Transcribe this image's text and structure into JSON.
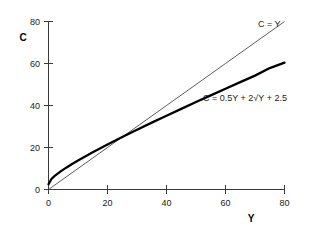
{
  "chart_data": {
    "type": "line",
    "title": "",
    "xlabel": "Y",
    "ylabel": "C",
    "xlim": [
      0,
      80
    ],
    "ylim": [
      0,
      80
    ],
    "grid": false,
    "legend_position": "inline-right",
    "xticks": [
      0,
      20,
      40,
      60,
      80
    ],
    "yticks": [
      0,
      20,
      40,
      60,
      80
    ],
    "xtick_labels": [
      "0",
      "20",
      "40",
      "60",
      "80"
    ],
    "ytick_labels": [
      "0",
      "20",
      "40",
      "60",
      "80"
    ],
    "series": [
      {
        "name": "C = Y",
        "label": "C = Y",
        "style": "thin",
        "color": "#4a4a4a",
        "x": [
          0,
          10,
          20,
          30,
          40,
          50,
          60,
          70,
          80
        ],
        "values": [
          0,
          10,
          20,
          30,
          40,
          50,
          60,
          70,
          80
        ],
        "label_x": 70,
        "label_y": 80
      },
      {
        "name": "C = 0.5Y + 2sqrt(Y) + 2.5",
        "label": "C = 0.5Y + 2√Y + 2.5",
        "style": "thick",
        "color": "#000000",
        "x": [
          0,
          1,
          2,
          4,
          6,
          8,
          10,
          15,
          20,
          25,
          30,
          35,
          40,
          45,
          50,
          55,
          60,
          65,
          70,
          75,
          80
        ],
        "values": [
          2.5,
          5.0,
          6.33,
          8.5,
          10.4,
          12.16,
          13.82,
          17.75,
          21.44,
          25.0,
          28.46,
          31.83,
          35.15,
          38.41,
          41.64,
          44.83,
          48.0,
          51.13,
          54.23,
          57.82,
          60.39
        ],
        "label_x": 40,
        "label_y": 44
      }
    ],
    "intersection": {
      "x": 28.0,
      "y": 28.0
    }
  },
  "labels": {
    "y_axis_title": "C",
    "x_axis_title": "Y",
    "series_one": "C = Y",
    "series_two": "C = 0.5Y + 2√Y + 2.5"
  },
  "ticks": {
    "y": [
      "80",
      "60",
      "40",
      "20",
      "0"
    ],
    "x": [
      "0",
      "20",
      "40",
      "60",
      "80"
    ]
  }
}
